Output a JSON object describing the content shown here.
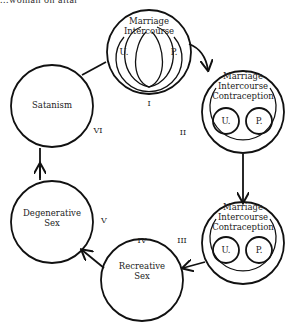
{
  "header": {
    "cropped_caption": "...woman on altar"
  },
  "stages": [
    {
      "id": "I",
      "numeral": "I",
      "lines": [
        "Marriage",
        "Intercourse"
      ],
      "inner": [
        "U.",
        "P."
      ],
      "style": "overlapping-loops"
    },
    {
      "id": "II",
      "numeral": "II",
      "lines": [
        "Marriage",
        "Intercourse",
        "Contraception"
      ],
      "inner": [
        "U.",
        "P."
      ],
      "style": "separate-circles"
    },
    {
      "id": "III",
      "numeral": "III",
      "lines": [
        "Marriage",
        "Intercourse",
        "Contraception"
      ],
      "inner": [
        "U.",
        "P."
      ],
      "style": "separate-circles"
    },
    {
      "id": "IV",
      "numeral": "IV",
      "lines": [
        "Recreative",
        "Sex"
      ]
    },
    {
      "id": "V",
      "numeral": "V",
      "lines": [
        "Degenerative",
        "Sex"
      ]
    },
    {
      "id": "VI",
      "numeral": "VI",
      "lines": [
        "Satanism"
      ]
    }
  ],
  "colors": {
    "ink": "#111111",
    "background": "#ffffff"
  }
}
